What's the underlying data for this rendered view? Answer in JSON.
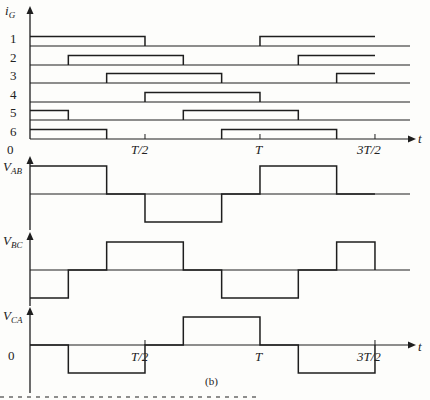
{
  "figure": {
    "caption": "(b)",
    "axis_labels": {
      "top_y": "i",
      "top_y_sub": "G",
      "t_axis": "t",
      "zero_top": "0",
      "zero_bottom": "0"
    },
    "time_ticks": [
      "T/2",
      "T",
      "3T/2"
    ],
    "gate_rows": [
      {
        "label": "1",
        "on_intervals_sixths": [
          [
            0,
            3
          ],
          [
            6,
            9
          ]
        ]
      },
      {
        "label": "2",
        "on_intervals_sixths": [
          [
            1,
            4
          ],
          [
            7,
            9
          ]
        ]
      },
      {
        "label": "3",
        "on_intervals_sixths": [
          [
            2,
            5
          ],
          [
            8,
            9
          ]
        ]
      },
      {
        "label": "4",
        "on_intervals_sixths": [
          [
            3,
            6
          ]
        ]
      },
      {
        "label": "5",
        "on_intervals_sixths": [
          [
            0,
            1
          ],
          [
            4,
            7
          ]
        ]
      },
      {
        "label": "6",
        "on_intervals_sixths": [
          [
            0,
            2
          ],
          [
            5,
            8
          ]
        ]
      }
    ],
    "voltage_waveforms": [
      {
        "name": "V",
        "sub": "AB",
        "levels_per_sixth": [
          1,
          1,
          0,
          -1,
          -1,
          0,
          1,
          1,
          0
        ]
      },
      {
        "name": "V",
        "sub": "BC",
        "levels_per_sixth": [
          -1,
          0,
          1,
          1,
          0,
          -1,
          -1,
          0,
          1
        ]
      },
      {
        "name": "V",
        "sub": "CA",
        "levels_per_sixth": [
          0,
          -1,
          -1,
          0,
          1,
          1,
          0,
          -1,
          -1
        ]
      }
    ]
  },
  "chart_data": {
    "type": "line",
    "xlabel": "t",
    "x_ticks": [
      "0",
      "T/2",
      "T",
      "3T/2"
    ],
    "x_range_sixths": [
      0,
      9
    ],
    "series": [
      {
        "name": "i_G1",
        "values": [
          1,
          1,
          1,
          0,
          0,
          0,
          1,
          1,
          1
        ]
      },
      {
        "name": "i_G2",
        "values": [
          0,
          1,
          1,
          1,
          0,
          0,
          0,
          1,
          1
        ]
      },
      {
        "name": "i_G3",
        "values": [
          0,
          0,
          1,
          1,
          1,
          0,
          0,
          0,
          1
        ]
      },
      {
        "name": "i_G4",
        "values": [
          0,
          0,
          0,
          1,
          1,
          1,
          0,
          0,
          0
        ]
      },
      {
        "name": "i_G5",
        "values": [
          1,
          0,
          0,
          0,
          1,
          1,
          1,
          0,
          0
        ]
      },
      {
        "name": "i_G6",
        "values": [
          1,
          1,
          0,
          0,
          0,
          1,
          1,
          1,
          0
        ]
      },
      {
        "name": "V_AB",
        "values": [
          1,
          1,
          0,
          -1,
          -1,
          0,
          1,
          1,
          0
        ]
      },
      {
        "name": "V_BC",
        "values": [
          -1,
          0,
          1,
          1,
          0,
          -1,
          -1,
          0,
          1
        ]
      },
      {
        "name": "V_CA",
        "values": [
          0,
          -1,
          -1,
          0,
          1,
          1,
          0,
          -1,
          -1
        ]
      }
    ],
    "grid": false,
    "legend": "none"
  }
}
